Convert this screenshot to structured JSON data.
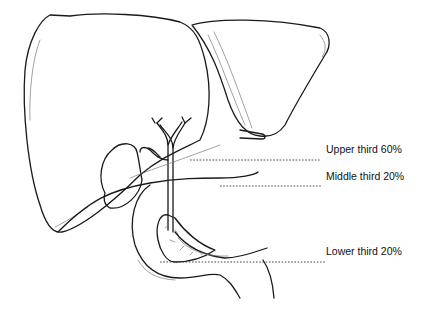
{
  "diagram": {
    "labels": [
      {
        "id": "upper",
        "text": "Upper third 60%"
      },
      {
        "id": "middle",
        "text": "Middle third 20%"
      },
      {
        "id": "lower",
        "text": "Lower third 20%"
      }
    ],
    "colors": {
      "line": "#1a1a1a",
      "background": "#ffffff"
    }
  }
}
